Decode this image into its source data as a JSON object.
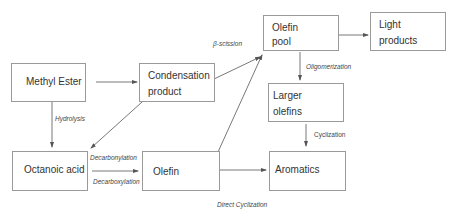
{
  "diagram": {
    "nodes": {
      "methyl_ester": {
        "lines": [
          "Methyl Ester"
        ]
      },
      "condensation_product": {
        "lines": [
          "Condensation",
          "product"
        ]
      },
      "olefin_pool": {
        "lines": [
          "Olefin",
          "pool"
        ]
      },
      "light_products": {
        "lines": [
          "Light",
          "products"
        ]
      },
      "larger_olefins": {
        "lines": [
          "Larger",
          "olefins"
        ]
      },
      "octanoic_acid": {
        "lines": [
          "Octanoic acid"
        ]
      },
      "olefin": {
        "lines": [
          "Olefin"
        ]
      },
      "aromatics": {
        "lines": [
          "Aromatics"
        ]
      }
    },
    "edge_labels": {
      "hydrolysis": "Hydrolysis",
      "beta_scission": "β-scission",
      "oligomerization": "Oligomerization",
      "cyclization": "Cyclization",
      "decarbonylation": "Decarbonylation",
      "decarboxylation": "Decarboxylation",
      "direct_cyclization": "Direct Cyclization"
    },
    "edges": [
      {
        "from": "Methyl Ester",
        "to": "Condensation product"
      },
      {
        "from": "Methyl Ester",
        "to": "Octanoic acid",
        "label": "Hydrolysis"
      },
      {
        "from": "Condensation product",
        "to": "Octanoic acid"
      },
      {
        "from": "Condensation product",
        "to": "Olefin pool",
        "label": "β-scission"
      },
      {
        "from": "Olefin",
        "to": "Olefin pool"
      },
      {
        "from": "Olefin pool",
        "to": "Light products"
      },
      {
        "from": "Olefin pool",
        "to": "Larger olefins",
        "label": "Oligomerization"
      },
      {
        "from": "Larger olefins",
        "to": "Aromatics",
        "label": "Cyclization"
      },
      {
        "from": "Octanoic acid",
        "to": "Olefin",
        "label": "Decarbonylation / Decarboxylation"
      },
      {
        "from": "Olefin",
        "to": "Aromatics",
        "label": "Direct Cyclization"
      }
    ],
    "colors": {
      "box_border": "#9a9a9a",
      "arrow": "#555555",
      "text": "#333333"
    }
  }
}
